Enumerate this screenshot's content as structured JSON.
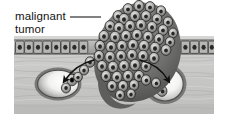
{
  "figure": {
    "background_color": "#ffffff",
    "tissue_block": {
      "x": 14,
      "y": 36,
      "width": 200,
      "height": 78,
      "stroma_color": "#c9c9c7",
      "stroma_shadow_color": "#9a9a98"
    },
    "annotations": [
      {
        "id": "malignant-tumor-label",
        "line1": "malignant",
        "line2": "tumor",
        "text_color": "#141414",
        "leader_line": {
          "color": "#1a1a1a",
          "x1": 70,
          "y1": 17,
          "x2": 101,
          "y2": 17
        }
      }
    ],
    "structures": [
      {
        "id": "epithelium",
        "name": "epithelial cell layer",
        "description": "single row of cuboidal cells with dark central nuclei",
        "y_top": 40,
        "y_bottom": 54,
        "cell_fill": "#b2b2b0",
        "cell_stroke": "#3c3c3a",
        "nucleus_color": "#2b2b29",
        "cell_count": 26
      },
      {
        "id": "tumor-mass",
        "name": "malignant tumor",
        "description": "mound of pleomorphic tumor cells breaching the epithelium and invading the stroma",
        "peak_x": 140,
        "peak_y": 2,
        "fill": "#6e6e6c",
        "cell_stroke": "#2a2a28",
        "cell_lumen": "#d8d8d6"
      },
      {
        "id": "vessel-left",
        "name": "left blood vessel lumen",
        "cx": 58,
        "cy": 84,
        "rx": 22,
        "ry": 15,
        "wall_color": "#5e5e5c",
        "lumen_color": "#fbfbfa"
      },
      {
        "id": "vessel-right",
        "name": "right blood vessel lumen",
        "cx": 165,
        "cy": 84,
        "rx": 19,
        "ry": 18,
        "wall_color": "#5e5e5c",
        "lumen_color": "#fbfbfa"
      },
      {
        "id": "arrow-left",
        "name": "metastasis arrow into left vessel",
        "color": "#111111",
        "direction": "curves left and down into the left vessel"
      },
      {
        "id": "arrow-right",
        "name": "metastasis arrow into right vessel",
        "color": "#111111",
        "direction": "curves right and down into the right vessel"
      },
      {
        "id": "invading-cell-strand",
        "name": "strand of tumor cells entering right vessel",
        "description": "chain of tumor cells extending from the mass toward the right vessel"
      }
    ]
  }
}
